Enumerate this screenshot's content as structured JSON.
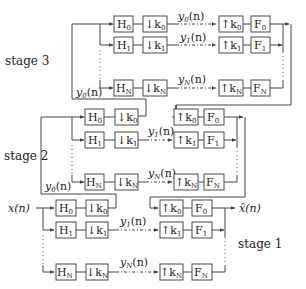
{
  "diagram": {
    "type": "multistage filter bank (tree-structured analysis/synthesis)",
    "input_label": "x(n)",
    "output_label": "x̂(n)",
    "stages": [
      {
        "label": "stage 1",
        "feedback_label": "",
        "channels": [
          {
            "analysis": "H",
            "analysis_sub": "0",
            "down": "↓k",
            "down_sub": "0",
            "signal": "",
            "up": "↑k",
            "up_sub": "0",
            "synthesis": "F",
            "synthesis_sub": "0"
          },
          {
            "analysis": "H",
            "analysis_sub": "1",
            "down": "↓k",
            "down_sub": "1",
            "signal": "y",
            "signal_sub": "1",
            "signal_arg": "(n)",
            "up": "↑k",
            "up_sub": "1",
            "synthesis": "F",
            "synthesis_sub": "1"
          },
          {
            "analysis": "H",
            "analysis_sub": "N",
            "down": "↓k",
            "down_sub": "N",
            "signal": "y",
            "signal_sub": "N",
            "signal_arg": "(n)",
            "up": "↑k",
            "up_sub": "N",
            "synthesis": "F",
            "synthesis_sub": "N"
          }
        ]
      },
      {
        "label": "stage 2",
        "input_label": "y0(n)",
        "input_sig": "y",
        "input_sub": "0",
        "input_arg": "(n)",
        "channels": [
          {
            "analysis": "H",
            "analysis_sub": "0",
            "down": "↓k",
            "down_sub": "0",
            "signal": "",
            "up": "↑k",
            "up_sub": "0",
            "synthesis": "F",
            "synthesis_sub": "0"
          },
          {
            "analysis": "H",
            "analysis_sub": "1",
            "down": "↓k",
            "down_sub": "1",
            "signal": "y",
            "signal_sub": "1",
            "signal_arg": "(n)",
            "up": "↑k",
            "up_sub": "1",
            "synthesis": "F",
            "synthesis_sub": "1"
          },
          {
            "analysis": "H",
            "analysis_sub": "N",
            "down": "↓k",
            "down_sub": "N",
            "signal": "y",
            "signal_sub": "N",
            "signal_arg": "(n)",
            "up": "↑k",
            "up_sub": "N",
            "synthesis": "F",
            "synthesis_sub": "N"
          }
        ]
      },
      {
        "label": "stage 3",
        "input_label": "y0(n)",
        "input_sig": "y",
        "input_sub": "0",
        "input_arg": "(n)",
        "channels": [
          {
            "analysis": "H",
            "analysis_sub": "0",
            "down": "↓k",
            "down_sub": "0",
            "signal": "y",
            "signal_sub": "0",
            "signal_arg": "(n)",
            "up": "↑k",
            "up_sub": "0",
            "synthesis": "F",
            "synthesis_sub": "0"
          },
          {
            "analysis": "H",
            "analysis_sub": "1",
            "down": "↓k",
            "down_sub": "1",
            "signal": "y",
            "signal_sub": "1",
            "signal_arg": "(n)",
            "up": "↑k",
            "up_sub": "1",
            "synthesis": "F",
            "synthesis_sub": "1"
          },
          {
            "analysis": "H",
            "analysis_sub": "N",
            "down": "↓k",
            "down_sub": "N",
            "signal": "y",
            "signal_sub": "N",
            "signal_arg": "(n)",
            "up": "↑k",
            "up_sub": "N",
            "synthesis": "F",
            "synthesis_sub": "N"
          }
        ]
      }
    ]
  }
}
